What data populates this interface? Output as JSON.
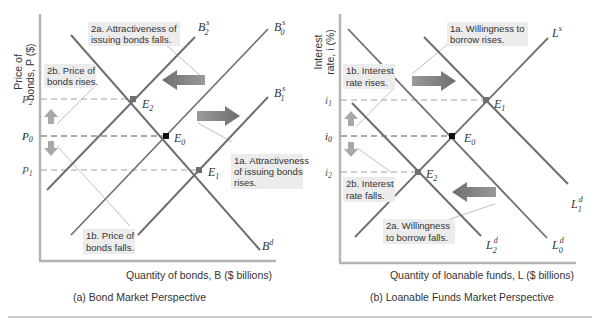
{
  "colors": {
    "curve": "#6e6e6e",
    "axis": "#b4b4b4",
    "dash": "#9a9a9a",
    "callout_bg": "#ececec",
    "leader": "#b0b0b0",
    "shift_arrow": "#7a7a7a",
    "small_arrow": "#a8a8a8",
    "eq0": "#111111",
    "eq_other": "#6e6e6e",
    "divider": "#bdbdbd"
  },
  "panel_a": {
    "caption": "(a) Bond Market Perspective",
    "y_axis_label_line1": "Price of",
    "y_axis_label_line2": "bonds, P ($)",
    "x_axis_label": "Quantity of bonds, B ($ billions)",
    "ticks": {
      "p2": "P",
      "p2_sub": "2",
      "p0": "P",
      "p0_sub": "0",
      "p1": "P",
      "p1_sub": "1"
    },
    "curves": {
      "b2s": {
        "main": "B",
        "sup": "s",
        "sub": "2"
      },
      "b0s": {
        "main": "B",
        "sup": "s",
        "sub": "0"
      },
      "b1s": {
        "main": "B",
        "sup": "s",
        "sub": "1"
      },
      "bd": {
        "main": "B",
        "sup": "d"
      }
    },
    "points": {
      "e2": {
        "main": "E",
        "sub": "2"
      },
      "e0": {
        "main": "E",
        "sub": "0"
      },
      "e1": {
        "main": "E",
        "sub": "1"
      }
    },
    "callouts": {
      "c2a": [
        "2a. Attractiveness of",
        "issuing bonds falls."
      ],
      "c2b": [
        "2b. Price of",
        "bonds rises."
      ],
      "c1a": [
        "1a. Attractiveness",
        "of issuing bonds",
        "rises."
      ],
      "c1b": [
        "1b. Price of",
        "bonds falls."
      ]
    }
  },
  "panel_b": {
    "caption": "(b) Loanable Funds Market Perspective",
    "y_axis_label_line1": "Interest",
    "y_axis_label_line2": "rate, i (%)",
    "x_axis_label": "Quantity of loanable funds, L ($ billions)",
    "ticks": {
      "i1": "i",
      "i1_sub": "1",
      "i0": "i",
      "i0_sub": "0",
      "i2": "i",
      "i2_sub": "2"
    },
    "curves": {
      "ls": {
        "main": "L",
        "sup": "s"
      },
      "l1d": {
        "main": "L",
        "sup": "d",
        "sub": "1"
      },
      "l0d": {
        "main": "L",
        "sup": "d",
        "sub": "0"
      },
      "l2d": {
        "main": "L",
        "sup": "d",
        "sub": "2"
      }
    },
    "points": {
      "e1": {
        "main": "E",
        "sub": "1"
      },
      "e0": {
        "main": "E",
        "sub": "0"
      },
      "e2": {
        "main": "E",
        "sub": "2"
      }
    },
    "callouts": {
      "c1a": [
        "1a. Willingness to",
        "borrow rises."
      ],
      "c1b": [
        "1b. Interest",
        "rate rises."
      ],
      "c2b": [
        "2b. Interest",
        "rate falls."
      ],
      "c2a": [
        "2a. Willingness",
        "to borrow falls."
      ]
    }
  }
}
